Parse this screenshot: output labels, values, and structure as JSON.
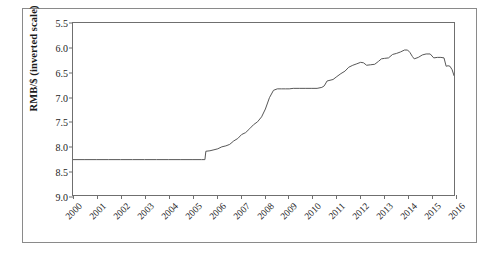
{
  "chart_data": {
    "type": "line",
    "title": "",
    "xlabel": "",
    "ylabel": "RMB/$ (inverted scale)",
    "ylim": [
      5.5,
      9.0
    ],
    "y_inverted": true,
    "xlim": [
      2000,
      2016
    ],
    "grid": false,
    "legend": "none",
    "ytick_labels": [
      "5.5",
      "6.0",
      "6.5",
      "7.0",
      "7.5",
      "8.0",
      "8.5",
      "9.0"
    ],
    "ytick_values": [
      5.5,
      6.0,
      6.5,
      7.0,
      7.5,
      8.0,
      8.5,
      9.0
    ],
    "xtick_labels": [
      "2000",
      "2001",
      "2002",
      "2003",
      "2004",
      "2005",
      "2006",
      "2007",
      "2008",
      "2009",
      "2010",
      "2011",
      "2012",
      "2013",
      "2014",
      "2015",
      "2016"
    ],
    "xtick_values": [
      2000,
      2001,
      2002,
      2003,
      2004,
      2005,
      2006,
      2007,
      2008,
      2009,
      2010,
      2011,
      2012,
      2013,
      2014,
      2015,
      2016
    ],
    "series": [
      {
        "name": "RMB per USD",
        "color": "#555555",
        "x": [
          2000.0,
          2000.5,
          2001.0,
          2001.5,
          2002.0,
          2002.5,
          2003.0,
          2003.5,
          2004.0,
          2004.5,
          2005.0,
          2005.4,
          2005.54,
          2005.58,
          2005.75,
          2005.92,
          2006.08,
          2006.25,
          2006.42,
          2006.58,
          2006.75,
          2006.92,
          2007.08,
          2007.25,
          2007.42,
          2007.58,
          2007.75,
          2007.92,
          2008.08,
          2008.25,
          2008.42,
          2008.58,
          2008.75,
          2008.92,
          2009.08,
          2009.25,
          2009.5,
          2009.75,
          2010.0,
          2010.25,
          2010.45,
          2010.55,
          2010.67,
          2010.75,
          2010.92,
          2011.08,
          2011.25,
          2011.42,
          2011.58,
          2011.75,
          2011.92,
          2012.08,
          2012.2,
          2012.33,
          2012.5,
          2012.67,
          2012.83,
          2012.95,
          2013.08,
          2013.25,
          2013.42,
          2013.58,
          2013.75,
          2013.92,
          2014.05,
          2014.15,
          2014.25,
          2014.33,
          2014.5,
          2014.67,
          2014.83,
          2015.0,
          2015.15,
          2015.3,
          2015.45,
          2015.58,
          2015.67,
          2015.75,
          2015.83,
          2015.92,
          2016.0
        ],
        "y": [
          8.28,
          8.28,
          8.28,
          8.28,
          8.28,
          8.28,
          8.28,
          8.28,
          8.28,
          8.28,
          8.28,
          8.28,
          8.28,
          8.11,
          8.1,
          8.08,
          8.06,
          8.02,
          8.0,
          7.97,
          7.9,
          7.85,
          7.77,
          7.73,
          7.65,
          7.57,
          7.51,
          7.41,
          7.25,
          7.02,
          6.87,
          6.84,
          6.84,
          6.84,
          6.84,
          6.83,
          6.83,
          6.83,
          6.83,
          6.83,
          6.81,
          6.78,
          6.68,
          6.67,
          6.65,
          6.59,
          6.53,
          6.48,
          6.4,
          6.36,
          6.33,
          6.3,
          6.31,
          6.36,
          6.35,
          6.34,
          6.28,
          6.23,
          6.22,
          6.21,
          6.14,
          6.12,
          6.09,
          6.05,
          6.05,
          6.1,
          6.18,
          6.23,
          6.2,
          6.15,
          6.13,
          6.13,
          6.21,
          6.2,
          6.2,
          6.21,
          6.38,
          6.37,
          6.38,
          6.45,
          6.57
        ]
      }
    ]
  }
}
